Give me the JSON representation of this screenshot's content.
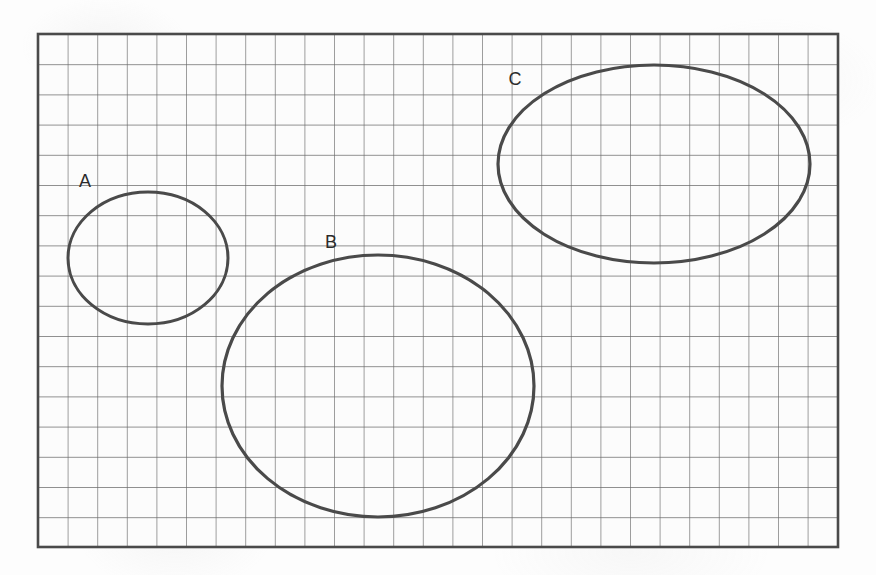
{
  "figure": {
    "kind": "grid-paper-ellipses",
    "canvas": {
      "width": 876,
      "height": 575
    },
    "colors": {
      "page_background": "#fdfdfd",
      "grid_line": "#6a6a6a",
      "grid_border": "#4a4a4a",
      "ellipse_stroke": "#4a4a4a",
      "label_text": "#2b2b2b"
    },
    "grid": {
      "x": 38,
      "y": 34,
      "width": 800,
      "height": 513,
      "columns": 27,
      "rows": 17,
      "cell_width": 29.6,
      "cell_height": 30.2,
      "line_width": 1.3,
      "border_width": 2.6
    },
    "shapes": [
      {
        "label": "A",
        "cx": 148,
        "cy": 258,
        "rx": 80,
        "ry": 66,
        "stroke_width": 3,
        "label_x": 85,
        "label_y": 182,
        "grid_cells_wide": 5.4,
        "grid_cells_tall": 4.4
      },
      {
        "label": "B",
        "cx": 378,
        "cy": 386,
        "rx": 156,
        "ry": 131,
        "stroke_width": 3.2,
        "label_x": 331,
        "label_y": 243,
        "grid_cells_wide": 10.5,
        "grid_cells_tall": 8.7
      },
      {
        "label": "C",
        "cx": 654,
        "cy": 164,
        "rx": 156,
        "ry": 99,
        "stroke_width": 3.2,
        "label_x": 515,
        "label_y": 80,
        "grid_cells_wide": 10.5,
        "grid_cells_tall": 6.6
      }
    ]
  },
  "chart_data": {
    "type": "scatter",
    "title": "",
    "xlabel": "",
    "ylabel": "",
    "grid": true,
    "legend": "none",
    "annotations": [
      "A",
      "B",
      "C"
    ],
    "series": [
      {
        "name": "Ellipse A",
        "shape": "ellipse",
        "center": [
          148,
          258
        ],
        "radii": [
          80,
          66
        ],
        "width_in_cells": 5.4,
        "height_in_cells": 4.4
      },
      {
        "name": "Ellipse B",
        "shape": "ellipse",
        "center": [
          378,
          386
        ],
        "radii": [
          156,
          131
        ],
        "width_in_cells": 10.5,
        "height_in_cells": 8.7
      },
      {
        "name": "Ellipse C",
        "shape": "ellipse",
        "center": [
          654,
          164
        ],
        "radii": [
          156,
          99
        ],
        "width_in_cells": 10.5,
        "height_in_cells": 6.6
      }
    ]
  }
}
